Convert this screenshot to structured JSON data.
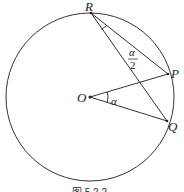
{
  "figure": {
    "labels": {
      "R": "R",
      "P": "P",
      "O": "O",
      "Q": "Q",
      "alpha": "α",
      "half_alpha_num": "α",
      "half_alpha_den": "2"
    },
    "caption": "图 5.2.2",
    "colors": {
      "stroke": "#333333",
      "text": "#222222",
      "background": "#ffffff"
    },
    "geometry": {
      "circle": {
        "cx": 90,
        "cy": 97,
        "r": 84
      },
      "points": {
        "O": [
          90,
          97
        ],
        "R": [
          91,
          13
        ],
        "P": [
          168,
          74
        ],
        "Q": [
          167,
          121
        ]
      }
    }
  }
}
